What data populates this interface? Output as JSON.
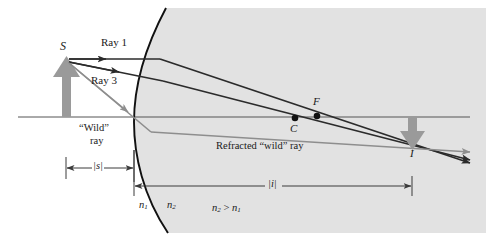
{
  "labels": {
    "source_point": "S",
    "ray1": "Ray 1",
    "ray3": "Ray 3",
    "wild_ray_line1": "“Wild”",
    "wild_ray_line2": "ray",
    "refracted_wild_ray": "Refracted “wild” ray",
    "center_of_curvature": "C",
    "focal_point": "F",
    "image_point": "I",
    "object_distance": "|s|",
    "image_distance": "|i|",
    "medium_left": "n",
    "medium_left_sub": "1",
    "medium_right": "n",
    "medium_right_sub": "2",
    "inequality_left": "n",
    "inequality_left_sub": "2",
    "inequality_sign": ">",
    "inequality_right": "n",
    "inequality_right_sub": "1"
  },
  "colors": {
    "background": "#ffffff",
    "medium_shade": "#e2e2e2",
    "ray_dark": "#2b2b2b",
    "ray_gray": "#8e8e8e",
    "object_arrow": "#9a9a9a",
    "image_arrow": "#9a9a9a",
    "axis": "#555555",
    "surface": "#111111",
    "dimension": "#3a3a3a",
    "text": "#1a1a1a"
  },
  "geometry": {
    "axis_y": 117,
    "vertex_x": 134,
    "object_x": 66,
    "object_tip_y": 57,
    "image_x": 412,
    "image_tip_y": 149,
    "center_x": 295,
    "focus_x": 317,
    "dim_s_y": 168,
    "dim_i_y": 186
  }
}
